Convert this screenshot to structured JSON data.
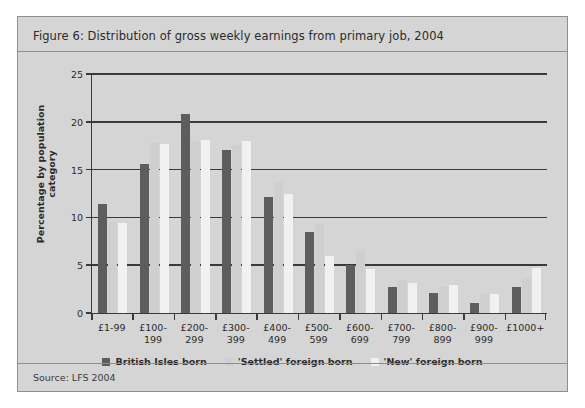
{
  "figure": {
    "title": "Figure 6: Distribution of gross weekly earnings from primary job, 2004",
    "source": "Source: LFS 2004"
  },
  "chart_data": {
    "type": "bar",
    "title": "Figure 6: Distribution of gross weekly earnings from primary job, 2004",
    "xlabel": "",
    "ylabel": "Percentage by population category",
    "ylim": [
      0,
      25
    ],
    "yticks": [
      0,
      5,
      10,
      15,
      20,
      25
    ],
    "grid": true,
    "legend_position": "bottom",
    "categories": [
      "£1-99",
      "£100-199",
      "£200-299",
      "£300-399",
      "£400-499",
      "£500-599",
      "£600-699",
      "£700-799",
      "£800-899",
      "£900-999",
      "£1000+"
    ],
    "category_lines": [
      [
        "£1-99"
      ],
      [
        "£100-",
        "199"
      ],
      [
        "£200-",
        "299"
      ],
      [
        "£300-",
        "399"
      ],
      [
        "£400-",
        "499"
      ],
      [
        "£500-",
        "599"
      ],
      [
        "£600-",
        "699"
      ],
      [
        "£700-",
        "799"
      ],
      [
        "£800-",
        "899"
      ],
      [
        "£900-",
        "999"
      ],
      [
        "£1000+"
      ]
    ],
    "series": [
      {
        "name": "British Isles born",
        "color": "#5d5d5d",
        "values": [
          11.4,
          15.6,
          20.8,
          17.0,
          12.1,
          8.5,
          5.0,
          2.7,
          2.1,
          1.0,
          2.7
        ]
      },
      {
        "name": "'Settled' foreign born",
        "color": "#cfcfcf",
        "values": [
          9.5,
          17.8,
          18.0,
          17.6,
          13.7,
          9.3,
          6.5,
          3.5,
          2.7,
          2.0,
          3.7
        ]
      },
      {
        "name": "'New' foreign born",
        "color": "#f1f1f1",
        "values": [
          9.4,
          17.7,
          18.1,
          18.0,
          12.4,
          6.0,
          4.6,
          3.1,
          2.9,
          2.0,
          4.7
        ]
      }
    ]
  },
  "legend": [
    {
      "label": "British Isles born",
      "color": "#5d5d5d"
    },
    {
      "label": "'Settled' foreign born",
      "color": "#cfcfcf"
    },
    {
      "label": "'New' foreign born",
      "color": "#f1f1f1"
    }
  ]
}
